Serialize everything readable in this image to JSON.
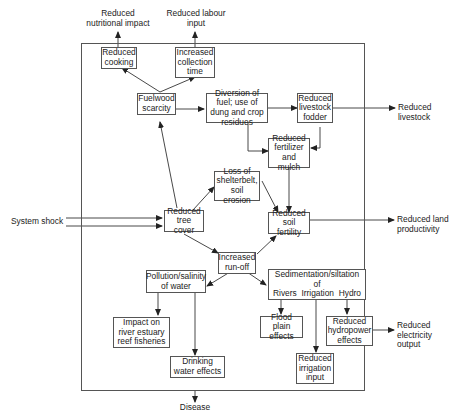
{
  "diagram": {
    "outside": {
      "reduced_nutritional_impact": "Reduced nutritional impact",
      "reduced_labour_input": "Reduced labour input",
      "reduced_livestock": "Reduced livestock",
      "system_shock": "System shock",
      "reduced_land_productivity": "Reduced land productivity",
      "reduced_electricity_output": "Reduced electricity output",
      "disease": "Disease"
    },
    "nodes": {
      "reduced_cooking": "Reduced cooking",
      "increased_collection_time": "Increased collection time",
      "fuelwood_scarcity": "Fuelwood scarcity",
      "diversion_of_fuel": "Diversion of fuel; use of dung and crop residues",
      "reduced_livestock_fodder": "Reduced livestock fodder",
      "reduced_fertilizer_mulch": "Reduced fertilizer and mulch",
      "loss_of_shelterbelt": "Loss of shelterbelt, soil erosion",
      "reduced_tree_cover": "Reduced tree cover",
      "reduced_soil_fertility": "Reduced soil fertility",
      "increased_runoff": "Increased run-off",
      "pollution_salinity": "Pollution/salinity of water",
      "sedimentation_title": "Sedimentation/siltation of",
      "sed_rivers": "Rivers",
      "sed_irrigation": "Irrigation",
      "sed_hydro": "Hydro",
      "impact_fisheries": "Impact on river estuary reef fisheries",
      "drinking_water": "Drinking water effects",
      "flood_plain": "Flood plain effects",
      "reduced_hydropower": "Reduced hydropower effects",
      "reduced_irrigation_input": "Reduced irrigation input"
    }
  }
}
